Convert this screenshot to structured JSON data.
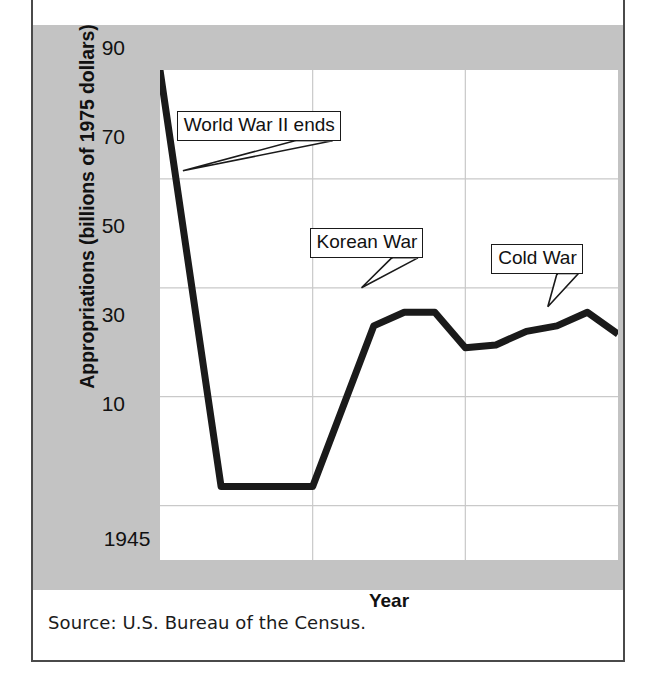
{
  "figure": {
    "source_note": "Source: U.S. Bureau of the Census.",
    "panel_color": "#c3c3c3",
    "plot_background": "#ffffff",
    "line_color": "#1a1a1a",
    "grid_color": "#c9c9c9"
  },
  "chart_data": {
    "type": "line",
    "title": "",
    "xlabel": "Year",
    "ylabel": "Appropriations (billions of 1975 dollars)",
    "xlim": [
      1945,
      1960
    ],
    "ylim": [
      0,
      90
    ],
    "xticks": [
      "1945",
      "1950",
      "1955",
      "1960"
    ],
    "xtick_values": [
      1945,
      1950,
      1955,
      1960
    ],
    "yticks": [
      "10",
      "30",
      "50",
      "70",
      "90"
    ],
    "ytick_values": [
      10,
      30,
      50,
      70,
      90
    ],
    "grid": true,
    "legend": "none",
    "series": [
      {
        "name": "Appropriations",
        "x": [
          1945,
          1947,
          1950,
          1952,
          1953,
          1954,
          1955,
          1956,
          1957,
          1958,
          1959,
          1960
        ],
        "values": [
          90,
          13.5,
          13.5,
          43,
          45.5,
          45.5,
          39,
          39.5,
          42,
          43,
          45.5,
          41.5
        ]
      }
    ],
    "annotations": [
      {
        "text": "World War II ends",
        "box_x": 1945.55,
        "box_y": 82.5,
        "point_x": 1945.75,
        "point_y": 71.5
      },
      {
        "text": "Korean War",
        "box_x": 1949.9,
        "box_y": 61.0,
        "point_x": 1951.6,
        "point_y": 50.0
      },
      {
        "text": "Cold War",
        "box_x": 1955.85,
        "box_y": 58.0,
        "point_x": 1957.7,
        "point_y": 46.5
      }
    ]
  }
}
